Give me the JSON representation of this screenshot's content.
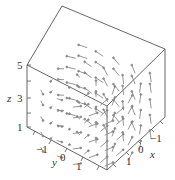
{
  "chart_data": {
    "type": "vector_field_3d",
    "title": "",
    "axes": {
      "x": {
        "label": "x",
        "ticks": [
          -1,
          0,
          1
        ],
        "range": [
          -2,
          2
        ]
      },
      "y": {
        "label": "y",
        "ticks": [
          -1,
          0,
          1
        ],
        "range": [
          -2,
          2
        ]
      },
      "z": {
        "label": "z",
        "ticks": [
          1,
          3,
          5
        ],
        "minor_ticks": [
          2,
          4
        ],
        "range": [
          1,
          5
        ]
      }
    },
    "grid": false,
    "legend": null,
    "colors": {
      "frame": "#555555",
      "arrow": "#888888",
      "text": "#333333"
    }
  },
  "labels": {
    "z_axis": "z",
    "z_ticks": [
      "5",
      "3",
      "1"
    ],
    "y_axis": "y",
    "y_ticks": [
      "−1",
      "0",
      "1"
    ],
    "x_axis": "x",
    "x_ticks": [
      "−1",
      "0",
      "1"
    ]
  }
}
